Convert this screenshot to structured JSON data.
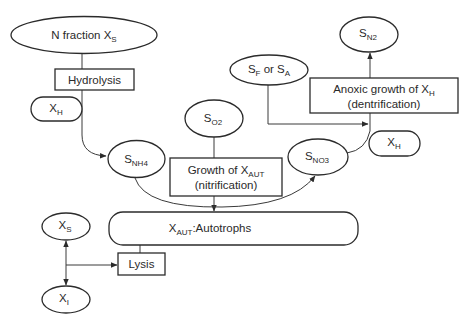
{
  "diagram": {
    "type": "nitrogen-transformation-flowchart",
    "nodes": {
      "n_fraction": {
        "main": "N fraction X",
        "sub": "S",
        "shape": "ellipse"
      },
      "hydrolysis": {
        "label": "Hydrolysis",
        "shape": "rectangle"
      },
      "xh_left": {
        "main": "X",
        "sub": "H",
        "shape": "pill"
      },
      "snh4": {
        "main": "S",
        "sub": "NH4",
        "shape": "ellipse"
      },
      "so2": {
        "main": "S",
        "sub": "O2",
        "shape": "ellipse"
      },
      "growth_aut": {
        "line1_main": "Growth of X",
        "line1_sub": "AUT",
        "line2": "(nitrification)",
        "shape": "rectangle"
      },
      "sno3": {
        "main": "S",
        "sub": "NO3",
        "shape": "ellipse"
      },
      "sf_sa": {
        "main1": "S",
        "sub1": "F",
        "mid": " or S",
        "sub2": "A",
        "shape": "ellipse"
      },
      "anoxic": {
        "line1_main": "Anoxic growth of X",
        "line1_sub": "H",
        "line2": "(dentrification)",
        "shape": "rectangle"
      },
      "sn2": {
        "main": "S",
        "sub": "N2",
        "shape": "ellipse"
      },
      "xh_right": {
        "main": "X",
        "sub": "H",
        "shape": "pill"
      },
      "autotrophs": {
        "main": "X",
        "sub": "AUT",
        "suffix": ":Autotrophs",
        "shape": "pill"
      },
      "xs": {
        "main": "X",
        "sub": "S",
        "shape": "ellipse"
      },
      "xi": {
        "main": "X",
        "sub": "I",
        "shape": "ellipse"
      },
      "lysis": {
        "label": "Lysis",
        "shape": "rectangle"
      }
    },
    "edges": [
      {
        "from": "n_fraction",
        "to": "hydrolysis",
        "arrow": false
      },
      {
        "from": "hydrolysis",
        "to": "snh4",
        "arrow": true
      },
      {
        "from": "xh_left",
        "to": "hydrolysis-path",
        "arrow": false
      },
      {
        "from": "so2",
        "to": "growth_aut",
        "arrow": false
      },
      {
        "from": "growth_aut",
        "to": "autotrophs",
        "arrow": true
      },
      {
        "from": "snh4",
        "to": "sno3",
        "arrow": true
      },
      {
        "from": "sno3",
        "to": "xh_right",
        "arrow": false
      },
      {
        "from": "sf_sa",
        "to": "anoxic-path",
        "arrow": true
      },
      {
        "from": "anoxic",
        "to": "sn2",
        "arrow": true
      },
      {
        "from": "autotrophs",
        "to": "lysis",
        "arrow": false
      },
      {
        "from": "branch",
        "to": "xs",
        "arrow": true
      },
      {
        "from": "branch",
        "to": "xi",
        "arrow": true
      },
      {
        "from": "branch",
        "to": "lysis",
        "arrow": true
      }
    ],
    "caption_fragment": ""
  }
}
